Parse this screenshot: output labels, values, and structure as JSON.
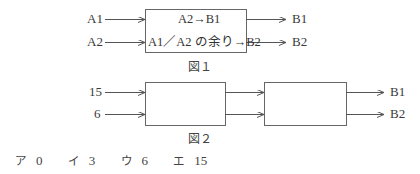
{
  "figure1": {
    "caption": "図１",
    "inputs": [
      "A1",
      "A2"
    ],
    "outputs": [
      "B1",
      "B2"
    ],
    "box_lines": [
      "A2→B1",
      "A1／A2 の余り→B2"
    ]
  },
  "figure2": {
    "caption": "図２",
    "inputs": [
      "15",
      "6"
    ],
    "outputs": [
      "B1",
      "B2"
    ]
  },
  "choices": [
    {
      "mark": "ア",
      "value": "0"
    },
    {
      "mark": "イ",
      "value": "3"
    },
    {
      "mark": "ウ",
      "value": "6"
    },
    {
      "mark": "エ",
      "value": "15"
    }
  ],
  "colors": {
    "line": "#555555",
    "text": "#3a3a3a"
  }
}
